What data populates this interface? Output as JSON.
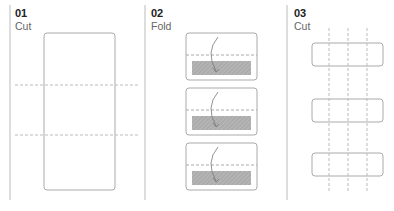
{
  "steps": [
    {
      "number": "01",
      "label": "Cut"
    },
    {
      "number": "02",
      "label": "Fold"
    },
    {
      "number": "03",
      "label": "Cut"
    }
  ],
  "colors": {
    "line": "#bbbbbb",
    "outline": "#aaaaaa",
    "hatch": "#a9a9a9",
    "text": "#222222"
  }
}
